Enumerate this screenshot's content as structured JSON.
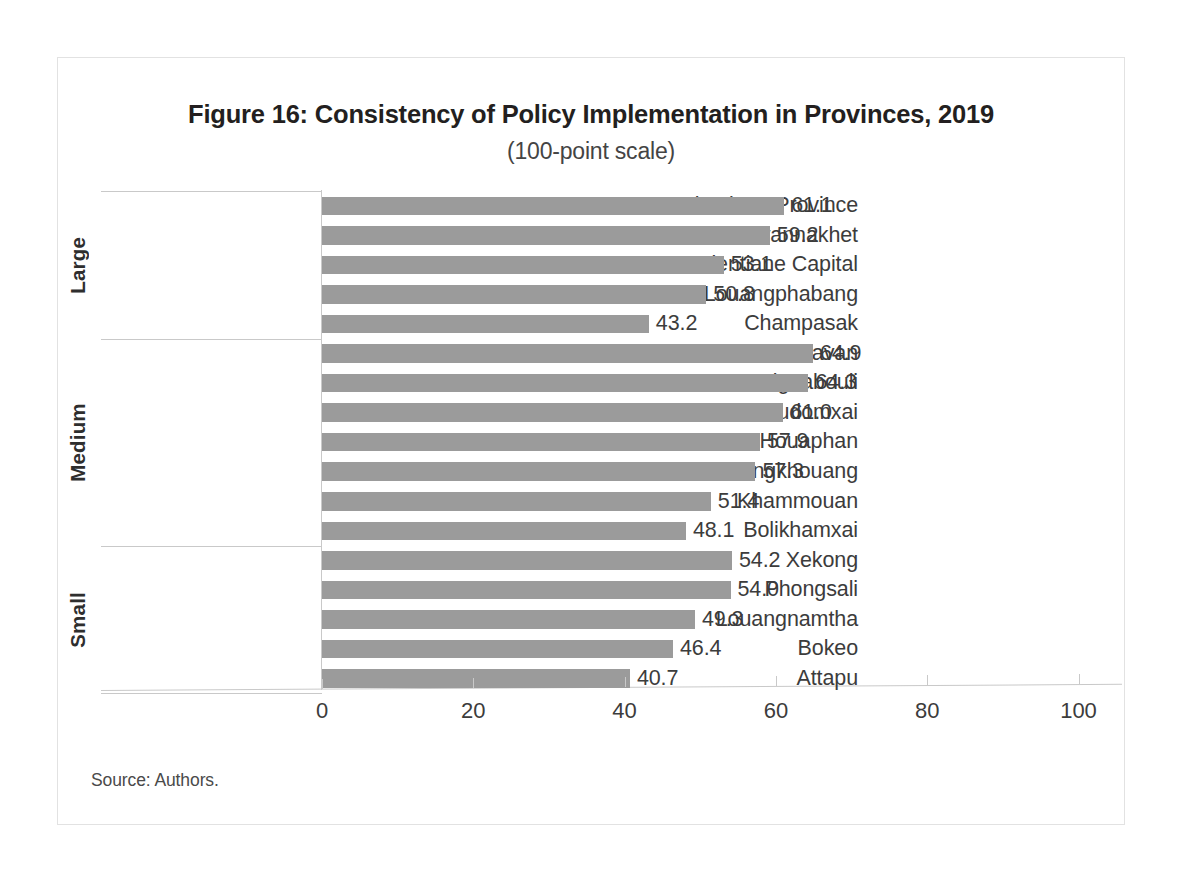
{
  "figure": {
    "title": "Figure 16: Consistency of Policy Implementation in Provinces, 2019",
    "subtitle": "(100-point scale)",
    "source": "Source: Authors."
  },
  "axis": {
    "ticks": [
      "0",
      "20",
      "40",
      "60",
      "80",
      "100"
    ]
  },
  "groups": [
    {
      "name": "Large"
    },
    {
      "name": "Medium"
    },
    {
      "name": "Small"
    }
  ],
  "bars": [
    {
      "label": "Vientiane Province",
      "value": "61.1",
      "group": "Large"
    },
    {
      "label": "Savannakhet",
      "value": "59.2",
      "group": "Large"
    },
    {
      "label": "Vientiane Capital",
      "value": "53.1",
      "group": "Large"
    },
    {
      "label": "Louangphabang",
      "value": "50.8",
      "group": "Large"
    },
    {
      "label": "Champasak",
      "value": "43.2",
      "group": "Large"
    },
    {
      "label": "Salavan",
      "value": "64.9",
      "group": "Medium"
    },
    {
      "label": "Xaignabouli",
      "value": "64.3",
      "group": "Medium"
    },
    {
      "label": "Oudomxai",
      "value": "61.0",
      "group": "Medium"
    },
    {
      "label": "Houaphan",
      "value": "57.9",
      "group": "Medium"
    },
    {
      "label": "Xiangkhouang",
      "value": "57.3",
      "group": "Medium"
    },
    {
      "label": "Khammouan",
      "value": "51.4",
      "group": "Medium"
    },
    {
      "label": "Bolikhamxai",
      "value": "48.1",
      "group": "Medium"
    },
    {
      "label": "Xekong",
      "value": "54.2",
      "group": "Small"
    },
    {
      "label": "Phongsali",
      "value": "54.0",
      "group": "Small"
    },
    {
      "label": "Louangnamtha",
      "value": "49.3",
      "group": "Small"
    },
    {
      "label": "Bokeo",
      "value": "46.4",
      "group": "Small"
    },
    {
      "label": "Attapu",
      "value": "40.7",
      "group": "Small"
    }
  ],
  "colors": {
    "bar": "#9b9b9b",
    "axis": "#c9c9c9",
    "text": "#3c3c3c",
    "frame": "#e2e2e2"
  },
  "chart_data": {
    "type": "bar",
    "orientation": "horizontal",
    "title": "Figure 16: Consistency of Policy Implementation in Provinces, 2019",
    "subtitle": "(100-point scale)",
    "xlabel": "",
    "ylabel": "",
    "xlim": [
      0,
      100
    ],
    "xticks": [
      0,
      20,
      40,
      60,
      80,
      100
    ],
    "grid": false,
    "legend": null,
    "bar_color": "#9b9b9b",
    "value_labels": true,
    "source": "Source: Authors.",
    "groups": [
      {
        "name": "Large",
        "categories": [
          "Vientiane Province",
          "Savannakhet",
          "Vientiane Capital",
          "Louangphabang",
          "Champasak"
        ],
        "values": [
          61.1,
          59.2,
          53.1,
          50.8,
          43.2
        ]
      },
      {
        "name": "Medium",
        "categories": [
          "Salavan",
          "Xaignabouli",
          "Oudomxai",
          "Houaphan",
          "Xiangkhouang",
          "Khammouan",
          "Bolikhamxai"
        ],
        "values": [
          64.9,
          64.3,
          61.0,
          57.9,
          57.3,
          51.4,
          48.1
        ]
      },
      {
        "name": "Small",
        "categories": [
          "Xekong",
          "Phongsali",
          "Louangnamtha",
          "Bokeo",
          "Attapu"
        ],
        "values": [
          54.2,
          54.0,
          49.3,
          46.4,
          40.7
        ]
      }
    ],
    "categories": [
      "Vientiane Province",
      "Savannakhet",
      "Vientiane Capital",
      "Louangphabang",
      "Champasak",
      "Salavan",
      "Xaignabouli",
      "Oudomxai",
      "Houaphan",
      "Xiangkhouang",
      "Khammouan",
      "Bolikhamxai",
      "Xekong",
      "Phongsali",
      "Louangnamtha",
      "Bokeo",
      "Attapu"
    ],
    "values": [
      61.1,
      59.2,
      53.1,
      50.8,
      43.2,
      64.9,
      64.3,
      61.0,
      57.9,
      57.3,
      51.4,
      48.1,
      54.2,
      54.0,
      49.3,
      46.4,
      40.7
    ]
  }
}
